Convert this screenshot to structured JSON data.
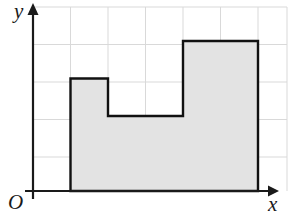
{
  "figure": {
    "type": "coordinate-grid-polygon",
    "background_color": "#ffffff",
    "grid_color": "#d9d9d9",
    "axis_color": "#1a1a1a",
    "outline_color": "#111111",
    "fill_color": "#e3e3e3"
  },
  "labels": {
    "y_axis": "y",
    "x_axis": "x",
    "origin": "O"
  },
  "chart_data": {
    "type": "scatter",
    "title": "",
    "xlabel": "x",
    "ylabel": "y",
    "xlim": [
      0,
      6.8
    ],
    "ylim": [
      0,
      4.9
    ],
    "grid": true,
    "legend": null,
    "x_ticks": [
      0,
      1,
      2,
      3,
      4,
      5,
      6
    ],
    "y_ticks": [
      0,
      1,
      2,
      3,
      4
    ],
    "tick_labels_shown": false,
    "series": [
      {
        "name": "shaded-region",
        "kind": "polygon",
        "closed": true,
        "fill": "#e3e3e3",
        "stroke": "#111111",
        "points": [
          [
            1,
            0
          ],
          [
            1,
            3
          ],
          [
            2,
            3
          ],
          [
            2,
            2
          ],
          [
            4,
            2
          ],
          [
            4,
            4
          ],
          [
            6,
            4
          ],
          [
            6,
            0
          ]
        ]
      }
    ],
    "annotations": []
  }
}
